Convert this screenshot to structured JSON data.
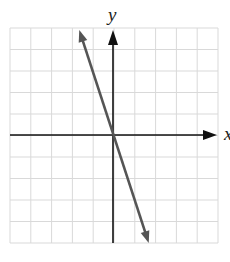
{
  "chart_data": {
    "type": "line",
    "title": "",
    "xlabel": "x",
    "ylabel": "y",
    "xlim": [
      -5,
      5
    ],
    "ylim": [
      -5,
      5
    ],
    "grid": true,
    "grid_step": 1,
    "series": [
      {
        "name": "y = -3x",
        "equation": "y = -3x",
        "x": [
          -1.67,
          0,
          1.67
        ],
        "y": [
          5,
          0,
          -5
        ],
        "color": "#555555",
        "arrows": "both"
      }
    ]
  },
  "labels": {
    "x_axis": "x",
    "y_axis": "y"
  },
  "colors": {
    "grid": "#d9d9d9",
    "axis": "#111111",
    "line": "#555555"
  }
}
